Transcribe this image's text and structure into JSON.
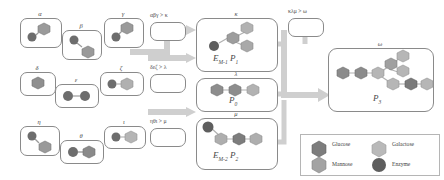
{
  "diagram": {
    "title_absent": true,
    "row1": {
      "nodes": [
        {
          "id": "alpha",
          "label": "α",
          "x": 20,
          "y": 18,
          "w": 40,
          "h": 28,
          "shapes": [
            {
              "type": "hexagon",
              "color": "#9a9a9a",
              "x": 17,
              "y": 6,
              "s": 12
            },
            {
              "type": "circle",
              "color": "#6d6d6d",
              "x": 6,
              "y": 14,
              "s": 9
            }
          ]
        },
        {
          "id": "beta",
          "label": "β",
          "x": 62,
          "y": 30,
          "w": 38,
          "h": 28,
          "shapes": [
            {
              "type": "circle",
              "color": "#6d6d6d",
              "x": 6,
              "y": 5,
              "s": 9
            },
            {
              "type": "hexagon",
              "color": "#9a9a9a",
              "x": 17,
              "y": 14,
              "s": 12
            }
          ]
        },
        {
          "id": "gamma",
          "label": "γ",
          "x": 104,
          "y": 18,
          "w": 38,
          "h": 28,
          "shapes": [
            {
              "type": "hexagon",
              "color": "#9a9a9a",
              "x": 16,
              "y": 5,
              "s": 12
            },
            {
              "type": "circle",
              "color": "#6d6d6d",
              "x": 6,
              "y": 14,
              "s": 9
            }
          ]
        }
      ],
      "condition": "αβγ > κ",
      "cond_x": 150,
      "cond_y": 14,
      "gate_x": 150,
      "gate_y": 22,
      "gate_w": 34,
      "gate_h": 17
    },
    "row2": {
      "nodes": [
        {
          "id": "delta",
          "label": "δ",
          "x": 20,
          "y": 72,
          "w": 34,
          "h": 22,
          "shapes": [
            {
              "type": "hexagon",
              "color": "#8f8f8f",
              "x": 10,
              "y": 6,
              "s": 12
            }
          ]
        },
        {
          "id": "epsilon",
          "label": "ε",
          "x": 55,
          "y": 84,
          "w": 42,
          "h": 22,
          "shapes": [
            {
              "type": "circle",
              "color": "#6d6d6d",
              "x": 7,
              "y": 6,
              "s": 10
            },
            {
              "type": "circle",
              "color": "#6d6d6d",
              "x": 23,
              "y": 6,
              "s": 10
            }
          ]
        },
        {
          "id": "zeta",
          "label": "ζ",
          "x": 100,
          "y": 72,
          "w": 42,
          "h": 22,
          "shapes": [
            {
              "type": "circle",
              "color": "#6d6d6d",
              "x": 6,
              "y": 6,
              "s": 9
            },
            {
              "type": "hexagon",
              "color": "#b0b0b0",
              "x": 18,
              "y": 5,
              "s": 12
            }
          ]
        }
      ],
      "condition": "δεζ > λ",
      "cond_x": 150,
      "cond_y": 66,
      "gate_x": 150,
      "gate_y": 74,
      "gate_w": 34,
      "gate_h": 17
    },
    "row3": {
      "nodes": [
        {
          "id": "eta",
          "label": "η",
          "x": 20,
          "y": 126,
          "w": 38,
          "h": 28,
          "shapes": [
            {
              "type": "circle",
              "color": "#6d6d6d",
              "x": 6,
              "y": 5,
              "s": 9
            },
            {
              "type": "hexagon",
              "color": "#9a9a9a",
              "x": 16,
              "y": 14,
              "s": 12
            }
          ]
        },
        {
          "id": "theta",
          "label": "θ",
          "x": 60,
          "y": 140,
          "w": 42,
          "h": 22,
          "shapes": [
            {
              "type": "circle",
              "color": "#6d6d6d",
              "x": 7,
              "y": 6,
              "s": 10
            },
            {
              "type": "hexagon",
              "color": "#8a8a8a",
              "x": 21,
              "y": 5,
              "s": 12
            }
          ]
        },
        {
          "id": "iota",
          "label": "ι",
          "x": 104,
          "y": 126,
          "w": 40,
          "h": 21,
          "shapes": [
            {
              "type": "circle",
              "color": "#6d6d6d",
              "x": 6,
              "y": 5,
              "s": 9
            },
            {
              "type": "hexagon",
              "color": "#b5b5b5",
              "x": 18,
              "y": 4,
              "s": 12
            }
          ]
        }
      ],
      "condition": "ηθι > μ",
      "cond_x": 150,
      "cond_y": 120,
      "gate_x": 150,
      "gate_y": 128,
      "gate_w": 34,
      "gate_h": 17
    },
    "mid": [
      {
        "id": "kappa",
        "label": "κ",
        "x": 196,
        "y": 18,
        "w": 80,
        "h": 52,
        "product": "E",
        "sub1": "M-1",
        "product2": "P",
        "sub2": "1"
      },
      {
        "id": "lambda",
        "label": "λ",
        "x": 196,
        "y": 78,
        "w": 80,
        "h": 32,
        "product": "P",
        "sub1": "0",
        "product2": "",
        "sub2": ""
      },
      {
        "id": "mu",
        "label": "μ",
        "x": 196,
        "y": 118,
        "w": 80,
        "h": 50,
        "product": "E",
        "sub1": "M-2",
        "product2": "P",
        "sub2": "2"
      }
    ],
    "final_gate": {
      "condition": "κλμ > ω",
      "x": 288,
      "y": 18,
      "w": 34,
      "h": 17,
      "cond_x": 288,
      "cond_y": 10
    },
    "omega": {
      "label": "ω",
      "x": 328,
      "y": 48,
      "w": 104,
      "h": 62,
      "product": "P",
      "sub": "3"
    },
    "legend": {
      "x": 300,
      "y": 134,
      "w": 138,
      "h": 40,
      "items": [
        {
          "name": "Glucose",
          "shape": "hexagon",
          "color": "#7d7d7d"
        },
        {
          "name": "Galactose",
          "shape": "hexagon",
          "color": "#b9b9b9"
        },
        {
          "name": "Mannose",
          "shape": "hexagon",
          "color": "#a3a3a3"
        },
        {
          "name": "Enzyme",
          "shape": "circle",
          "color": "#5e5e5e"
        }
      ]
    },
    "colors": {
      "glucose": "#7d7d7d",
      "galactose": "#b9b9b9",
      "mannose": "#a3a3a3",
      "enzyme": "#5e5e5e",
      "arrow": "#cfcfcf",
      "stroke": "#8a8a8a"
    }
  }
}
